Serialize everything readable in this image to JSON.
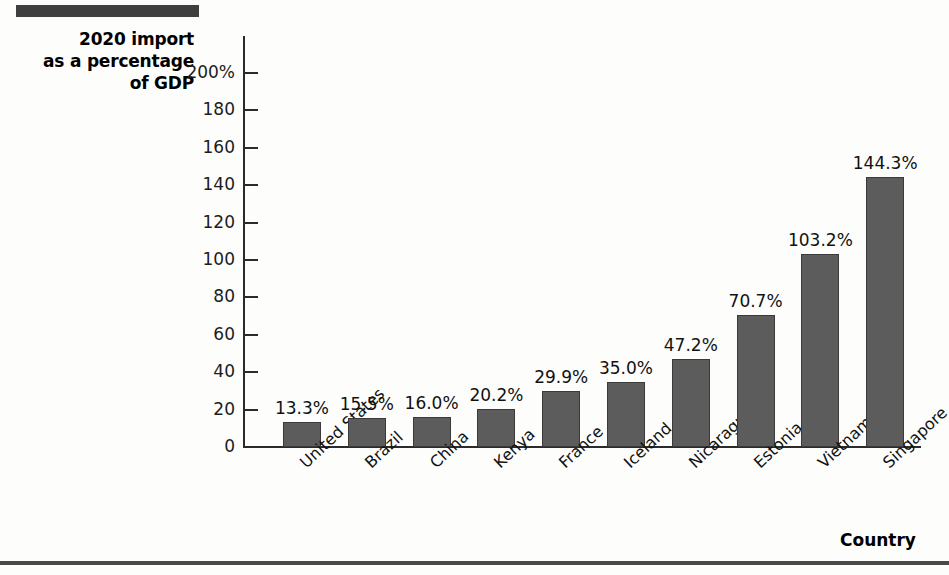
{
  "decorations": {
    "top_rule": "",
    "bottom_rule": ""
  },
  "chart_data": {
    "type": "bar",
    "title": "",
    "ylabel": "2020 import as a percentage of GDP",
    "ylabel_lines": [
      "2020 import",
      "as a percentage",
      "of GDP"
    ],
    "xlabel": "Country",
    "categories": [
      "United States",
      "Brazil",
      "China",
      "Kenya",
      "France",
      "Iceland",
      "Nicaragua",
      "Estonia",
      "Vietnam",
      "Singapore"
    ],
    "values": [
      13.3,
      15.5,
      16.0,
      20.2,
      29.9,
      35.0,
      47.2,
      70.7,
      103.2,
      144.3
    ],
    "value_labels": [
      "13.3%",
      "15.5%",
      "16.0%",
      "20.2%",
      "29.9%",
      "35.0%",
      "47.2%",
      "70.7%",
      "103.2%",
      "144.3%"
    ],
    "ylim": [
      0,
      200
    ],
    "ytick_values": [
      0,
      20,
      40,
      60,
      80,
      100,
      120,
      140,
      160,
      180,
      200
    ],
    "ytick_labels": [
      "0",
      "20",
      "40",
      "60",
      "80",
      "100",
      "120",
      "140",
      "160",
      "180",
      "200%"
    ],
    "grid": false,
    "legend": null,
    "bar_color": "#5c5c5c",
    "axis_color": "#2b2b2b"
  }
}
